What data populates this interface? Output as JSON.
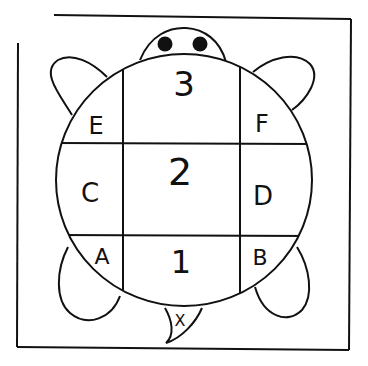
{
  "diagram": {
    "cell_labels": {
      "top_center": "3",
      "top_left": "E",
      "top_right": "F",
      "middle_center": "2",
      "middle_left": "C",
      "middle_right": "D",
      "bottom_left": "A",
      "bottom_center": "1",
      "bottom_right": "B",
      "tail": "X"
    },
    "colors": {
      "ink": "#111111",
      "paper": "#ffffff"
    }
  }
}
